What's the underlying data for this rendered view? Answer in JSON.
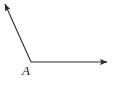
{
  "figure": {
    "kind": "geometry-angle-diagram",
    "background_color": "#ffffff",
    "stroke_color": "#2b2b2b",
    "stroke_width": 1.1,
    "canvas": {
      "width": 113,
      "height": 87
    },
    "vertex": {
      "label": "A",
      "x": 31,
      "y": 62,
      "label_x": 22,
      "label_y": 64
    },
    "rays": [
      {
        "name": "upper-left-ray",
        "from_x": 31,
        "from_y": 62,
        "to_x": 5,
        "to_y": 4,
        "arrowhead": "end"
      },
      {
        "name": "horizontal-right-ray",
        "from_x": 31,
        "from_y": 62,
        "to_x": 107,
        "to_y": 62,
        "arrowhead": "end"
      }
    ],
    "arrowhead": {
      "length": 7,
      "width": 5
    }
  }
}
